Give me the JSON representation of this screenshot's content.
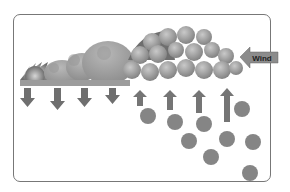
{
  "diagram": {
    "title": "",
    "wind_label": "Wind",
    "colors": {
      "frame": "#777777",
      "arrow": "#6f6f6f",
      "drop": "#858585",
      "cloud_light": "#bdbdbd",
      "cloud_dark": "#7a7a7a",
      "wind_arrow": "#8c8c8c"
    },
    "elements": {
      "downdraft_arrows": 4,
      "updraft_arrows": 4,
      "rain_drops": 10,
      "wind_arrow_direction": "left"
    }
  }
}
